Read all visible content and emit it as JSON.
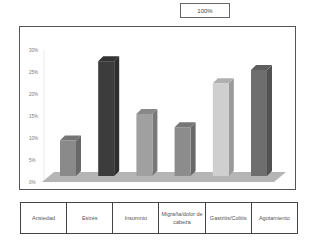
{
  "header": {
    "top_box_label": "100%"
  },
  "chart_data": {
    "type": "bar",
    "style": "3d-column",
    "title": "",
    "xlabel": "",
    "ylabel": "",
    "categories": [
      "Ansiedad",
      "Estrés",
      "Insomnio",
      "Migraña/dolor de cabeza",
      "Gastritis/Colitis",
      "Agotamiento"
    ],
    "values": [
      9,
      27,
      15,
      12,
      22,
      25
    ],
    "unit": "%",
    "ylim": [
      0,
      30
    ],
    "yticks": [
      "0%",
      "5%",
      "10%",
      "15%",
      "20%",
      "25%",
      "30%"
    ],
    "grid": false,
    "legend": "none",
    "bar_colors": [
      "#8a8a8a",
      "#3c3c3c",
      "#a0a0a0",
      "#8c8c8c",
      "#cfcfcf",
      "#6e6e6e"
    ]
  },
  "table": {
    "cells": [
      "Ansiedad",
      "Estrés",
      "Insomnio",
      "Migraña/dolor de cabeza",
      "Gastritis/Colitis",
      "Agotamiento"
    ]
  }
}
